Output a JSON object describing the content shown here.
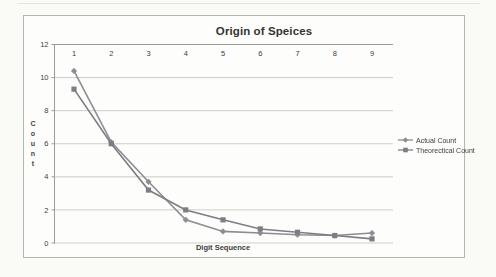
{
  "window": {
    "background": "#fafaf7",
    "frame_background": "#fdfdfb"
  },
  "chart_data": {
    "type": "line",
    "title": "Origin of Speices",
    "xlabel": "Digit Sequence",
    "ylabel": "Count",
    "ylabel_orientation": "stacked-vertical",
    "categories": [
      "1",
      "2",
      "3",
      "4",
      "5",
      "6",
      "7",
      "8",
      "9"
    ],
    "series": [
      {
        "name": "Actual Count",
        "marker": "diamond",
        "color": "#8d8d94",
        "values": [
          10.4,
          6.1,
          3.7,
          1.4,
          0.7,
          0.6,
          0.5,
          0.45,
          0.6
        ]
      },
      {
        "name": "Theorectical Count",
        "marker": "square",
        "color": "#7d7d84",
        "values": [
          9.3,
          6.0,
          3.2,
          2.0,
          1.4,
          0.85,
          0.65,
          0.45,
          0.25
        ]
      }
    ],
    "yticks": [
      0,
      2,
      4,
      6,
      8,
      10,
      12
    ],
    "ylim": [
      0,
      12
    ],
    "grid": true,
    "x_tick_labels_position": "top",
    "legend_position": "right",
    "colors": {
      "gridline": "#cdcdc9",
      "axis": "#9b9b97",
      "tick_text": "#3e3e3b",
      "frame_border": "#b6b6b1"
    }
  }
}
